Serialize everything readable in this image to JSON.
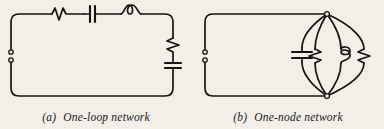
{
  "figure": {
    "background_color": "#f2efe9",
    "ink_color": "#17140f",
    "panels": [
      {
        "id": "a",
        "caption_label": "(a)",
        "caption_text": "One-loop network",
        "topology": "one-loop",
        "terminals": 2,
        "components": [
          {
            "name": "resistor",
            "symbol": "zigzag",
            "position": "top-left",
            "orientation": "horizontal"
          },
          {
            "name": "capacitor",
            "symbol": "parallel-plates",
            "position": "top-center",
            "orientation": "horizontal"
          },
          {
            "name": "inductor",
            "symbol": "coil-loop",
            "position": "top-right",
            "orientation": "horizontal"
          },
          {
            "name": "resistor",
            "symbol": "zigzag",
            "position": "right-upper",
            "orientation": "vertical"
          },
          {
            "name": "capacitor",
            "symbol": "parallel-plates",
            "position": "right-lower",
            "orientation": "vertical"
          }
        ]
      },
      {
        "id": "b",
        "caption_label": "(b)",
        "caption_text": "One-node network",
        "topology": "one-node",
        "terminals": 2,
        "nodes": 2,
        "components": [
          {
            "name": "capacitor",
            "symbol": "parallel-plates",
            "position": "branch-1",
            "orientation": "vertical"
          },
          {
            "name": "resistor",
            "symbol": "zigzag",
            "position": "branch-2",
            "orientation": "vertical"
          },
          {
            "name": "inductor",
            "symbol": "coil-loop",
            "position": "branch-3",
            "orientation": "vertical"
          },
          {
            "name": "resistor",
            "symbol": "zigzag",
            "position": "branch-4",
            "orientation": "vertical"
          }
        ]
      }
    ]
  }
}
